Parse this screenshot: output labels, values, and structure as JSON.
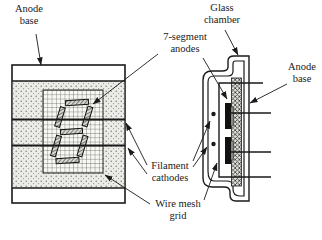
{
  "figure": {
    "labels": {
      "anode_base_left": {
        "line1": "Anode",
        "line2": "base"
      },
      "glass_chamber": {
        "line1": "Glass",
        "line2": "chamber"
      },
      "seven_segment_anodes": {
        "line1": "7-segment",
        "line2": "anodes"
      },
      "anode_base_right": {
        "line1": "Anode",
        "line2": "base"
      },
      "filament_cathodes": {
        "line1": "Filament",
        "line2": "cathodes"
      },
      "wire_mesh_grid": {
        "line1": "Wire mesh",
        "line2": "grid"
      }
    },
    "colors": {
      "ink": "#1a1a1a",
      "paper": "#ffffff",
      "stipple_bg": "#ebebe7",
      "mesh_bg": "#f8f8f5",
      "anode_fill": "#111111"
    }
  }
}
